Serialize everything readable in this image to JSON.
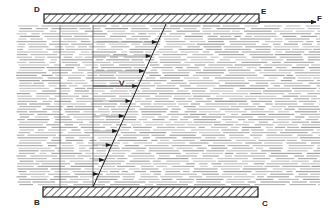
{
  "diagram": {
    "labels": {
      "top_left": "D",
      "top_right": "E",
      "force": "F",
      "bottom_left": "B",
      "bottom_right": "C",
      "velocity": "V"
    },
    "colors": {
      "line": "#1a1a1a",
      "fluid": "#9a9a9a",
      "background": "#ffffff"
    },
    "geometry": {
      "top_plate": {
        "x1": 44,
        "x2": 259,
        "y": 14,
        "height": 9
      },
      "bottom_plate": {
        "x1": 43,
        "x2": 258,
        "y": 187,
        "height": 10
      },
      "fluid": {
        "x1": 16,
        "x2": 320,
        "y1": 25,
        "y2": 186
      },
      "verticals_x": [
        60,
        93
      ],
      "profile_line": {
        "x1": 93,
        "y1": 187,
        "x2": 166,
        "y2": 24
      },
      "force_arrow": {
        "x1": 259,
        "x2": 316,
        "y": 22
      }
    },
    "velocity_arrow_heights": [
      42,
      56,
      71,
      86,
      101,
      116,
      131,
      145,
      160,
      174
    ]
  }
}
